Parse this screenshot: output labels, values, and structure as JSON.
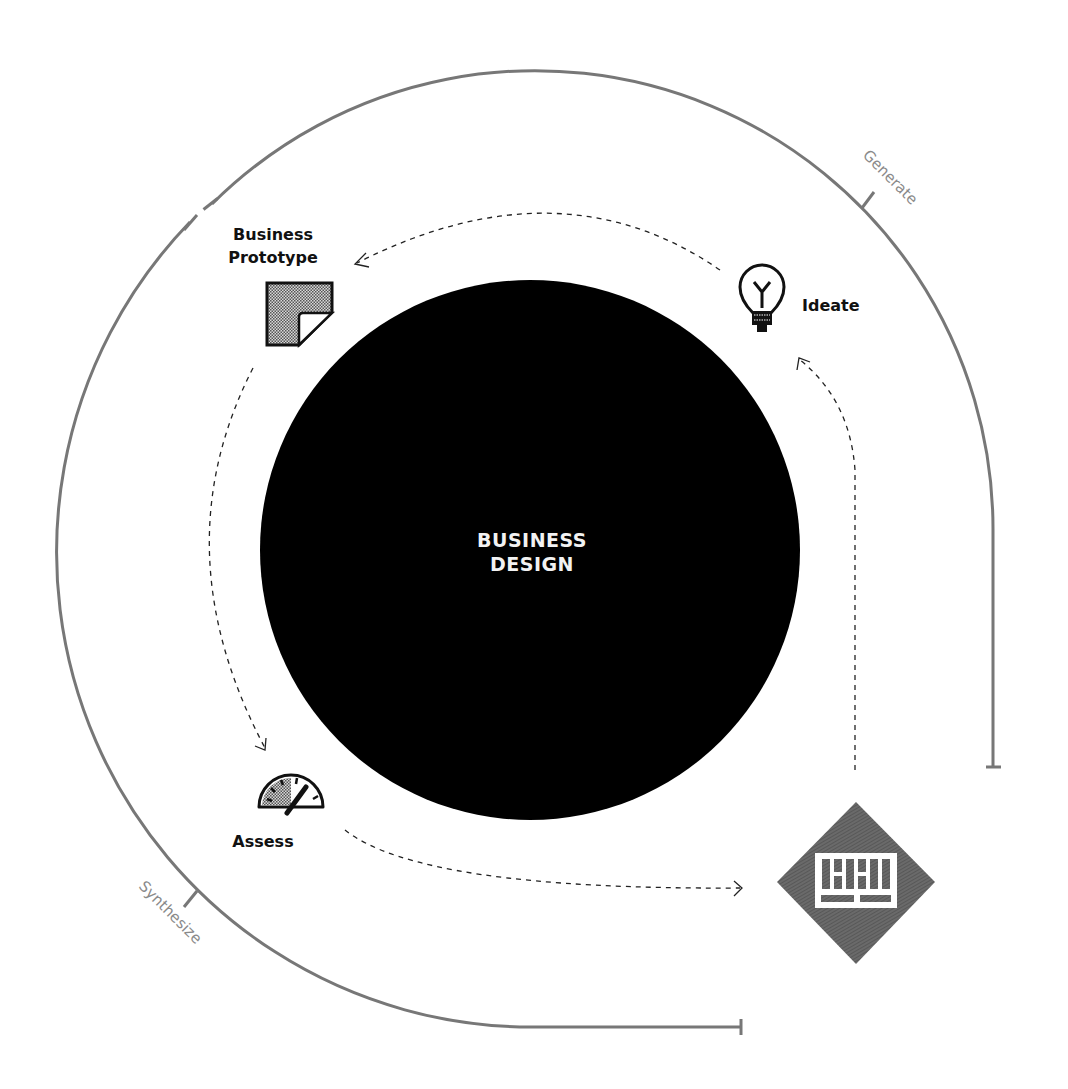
{
  "diagram": {
    "center": {
      "line1": "BUSINESS",
      "line2": "DESIGN"
    },
    "phases": [
      {
        "id": "generate",
        "label": "Generate"
      },
      {
        "id": "synthesize",
        "label": "Synthesize"
      }
    ],
    "steps": [
      {
        "id": "ideate",
        "label": "Ideate",
        "icon": "lightbulb-icon"
      },
      {
        "id": "business-prototype",
        "label_line1": "Business",
        "label_line2": "Prototype",
        "icon": "folded-paper-icon"
      },
      {
        "id": "assess",
        "label": "Assess",
        "icon": "gauge-icon"
      },
      {
        "id": "insight",
        "label": "",
        "icon": "diamond-grid-icon"
      }
    ],
    "flow": [
      "Ideate → Business Prototype",
      "Business Prototype → Assess",
      "Assess → Diamond",
      "Diamond → Ideate"
    ],
    "colors": {
      "background": "#ffffff",
      "core": "#000000",
      "arc": "#777777",
      "diamond": "#666666",
      "text": "#111111",
      "phase_text": "#8a8a8a"
    }
  }
}
